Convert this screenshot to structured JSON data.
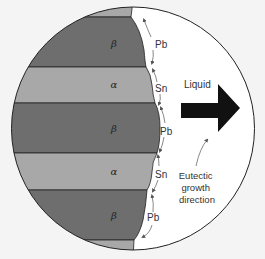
{
  "diagram": {
    "colors": {
      "background": "#f4f4f4",
      "liquid": "#ffffff",
      "beta_phase": "#6e6e6e",
      "alpha_phase": "#a8a8a8",
      "outline": "#222222",
      "arrow": "#111111",
      "diffusion_arrow": "#555555"
    },
    "phases": [
      {
        "symbol": "β",
        "label_y": 43
      },
      {
        "symbol": "α",
        "label_y": 85
      },
      {
        "symbol": "β",
        "label_y": 128
      },
      {
        "symbol": "α",
        "label_y": 172
      },
      {
        "symbol": "β",
        "label_y": 215
      }
    ],
    "diffusion_labels": [
      {
        "text": "Pb",
        "y": 45
      },
      {
        "text": "Sn",
        "y": 88
      },
      {
        "text": "Pb",
        "y": 131
      },
      {
        "text": "Sn",
        "y": 174
      },
      {
        "text": "Pb",
        "y": 217
      }
    ],
    "liquid_label": "Liquid",
    "growth_label": [
      "Eutectic",
      "growth",
      "direction"
    ]
  }
}
